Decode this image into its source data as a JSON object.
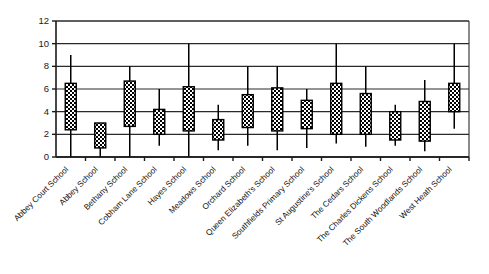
{
  "chart_data": {
    "type": "box",
    "title": "",
    "subtitle": "",
    "xlabel": "",
    "ylabel": "",
    "ylim": [
      0,
      12
    ],
    "ytick_step": 2,
    "yticks": [
      "0",
      "2",
      "4",
      "6",
      "8",
      "10",
      "12"
    ],
    "grid": "horizontal",
    "legend": "none",
    "categories": [
      "Abbey Court School",
      "Abbey School",
      "Bethany School",
      "Cobham Lane School",
      "Hayes School",
      "Meadows School",
      "Orchard School",
      "Queen Elizabeth's School",
      "Southfields Primary School",
      "St Augustine's School",
      "The Cedars School",
      "The Charles Dickens School",
      "The South Woodlands School",
      "West Heath School"
    ],
    "boxes": [
      {
        "category": "Abbey Court School",
        "whisker_low": 0.0,
        "q1": 2.4,
        "q3": 6.5,
        "whisker_high": 9.0
      },
      {
        "category": "Abbey School",
        "whisker_low": 0.0,
        "q1": 0.8,
        "q3": 3.0,
        "whisker_high": 3.0
      },
      {
        "category": "Bethany School",
        "whisker_low": 0.0,
        "q1": 2.7,
        "q3": 6.7,
        "whisker_high": 8.0
      },
      {
        "category": "Cobham Lane School",
        "whisker_low": 1.0,
        "q1": 2.0,
        "q3": 4.2,
        "whisker_high": 6.0
      },
      {
        "category": "Hayes School",
        "whisker_low": 0.0,
        "q1": 2.3,
        "q3": 6.2,
        "whisker_high": 10.0
      },
      {
        "category": "Meadows School",
        "whisker_low": 0.6,
        "q1": 1.5,
        "q3": 3.3,
        "whisker_high": 4.6
      },
      {
        "category": "Orchard School",
        "whisker_low": 1.0,
        "q1": 2.6,
        "q3": 5.5,
        "whisker_high": 8.0
      },
      {
        "category": "Queen Elizabeth's School",
        "whisker_low": 0.6,
        "q1": 2.3,
        "q3": 6.1,
        "whisker_high": 8.0
      },
      {
        "category": "Southfields Primary School",
        "whisker_low": 0.8,
        "q1": 2.5,
        "q3": 5.0,
        "whisker_high": 6.0
      },
      {
        "category": "St Augustine's School",
        "whisker_low": 1.2,
        "q1": 2.0,
        "q3": 6.5,
        "whisker_high": 10.0
      },
      {
        "category": "The Cedars School",
        "whisker_low": 0.9,
        "q1": 2.0,
        "q3": 5.6,
        "whisker_high": 8.0
      },
      {
        "category": "The Charles Dickens School",
        "whisker_low": 1.0,
        "q1": 1.5,
        "q3": 4.0,
        "whisker_high": 4.6
      },
      {
        "category": "The South Woodlands School",
        "whisker_low": 0.5,
        "q1": 1.4,
        "q3": 4.9,
        "whisker_high": 6.8
      },
      {
        "category": "West Heath School",
        "whisker_low": 2.5,
        "q1": 4.0,
        "q3": 6.5,
        "whisker_high": 10.0
      }
    ]
  },
  "colors": {
    "axis": "#1a1a1a",
    "grid": "#2a2a2a",
    "box_fill": "#ffffff",
    "box_stroke": "#000000",
    "hatch": "#000000"
  }
}
